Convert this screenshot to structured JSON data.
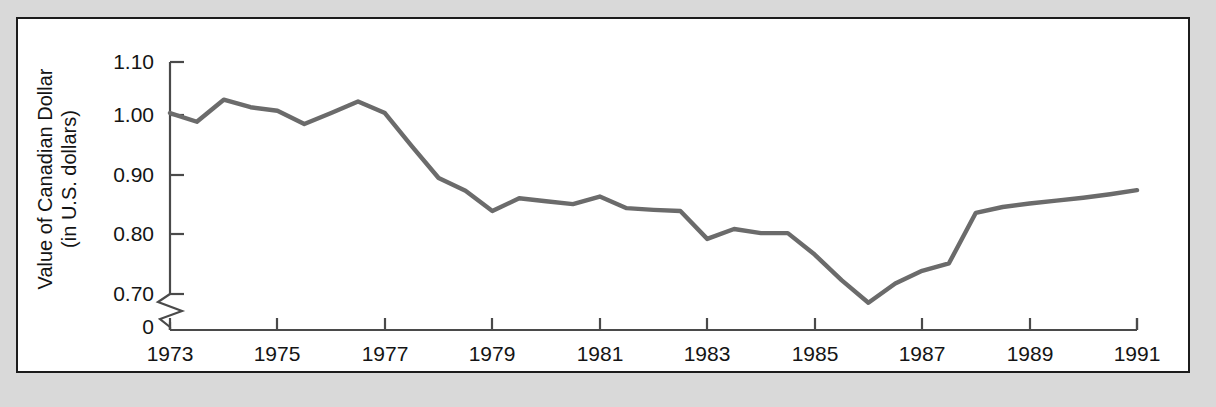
{
  "figure": {
    "background_color": "#d9d9d9",
    "panel_color": "#ffffff",
    "panel_border_color": "#1c1c1c"
  },
  "chart_data": {
    "type": "line",
    "title": "",
    "xlabel": "",
    "ylabel": "Value of Canadian Dollar (in U.S. dollars)",
    "ylabel_line1": "Value of Canadian Dollar",
    "ylabel_line2": "(in U.S. dollars)",
    "line_color": "#6b6b6b",
    "axis_color": "#4a4a4a",
    "grid": false,
    "legend": false,
    "legend_position": "none",
    "axis_break": true,
    "axis_break_note": "y-axis broken between 0 and 0.70",
    "xlim": [
      1973,
      1991
    ],
    "ylim": [
      0.7,
      1.1
    ],
    "yticks": [
      0,
      0.7,
      0.8,
      0.9,
      1.0,
      1.1
    ],
    "ytick_labels": [
      "0",
      "0.70",
      "0.80",
      "0.90",
      "1.00",
      "1.10"
    ],
    "xticks": [
      1973,
      1975,
      1977,
      1979,
      1981,
      1983,
      1985,
      1987,
      1989,
      1991
    ],
    "xtick_labels": [
      "1973",
      "1975",
      "1977",
      "1979",
      "1981",
      "1983",
      "1985",
      "1987",
      "1989",
      "1991"
    ],
    "x": [
      1973.0,
      1973.5,
      1974.0,
      1974.5,
      1975.0,
      1975.5,
      1976.0,
      1976.5,
      1977.0,
      1977.5,
      1978.0,
      1978.5,
      1979.0,
      1979.5,
      1980.0,
      1980.5,
      1981.0,
      1981.5,
      1982.0,
      1982.5,
      1983.0,
      1983.5,
      1984.0,
      1984.5,
      1985.0,
      1985.5,
      1986.0,
      1986.5,
      1987.0,
      1987.5,
      1988.0,
      1988.5,
      1989.0,
      1989.5,
      1990.0,
      1990.5,
      1991.0
    ],
    "values": [
      1.012,
      0.997,
      1.035,
      1.022,
      1.016,
      0.993,
      1.012,
      1.032,
      1.012,
      0.955,
      0.9,
      0.878,
      0.843,
      0.865,
      0.86,
      0.855,
      0.868,
      0.848,
      0.845,
      0.843,
      0.795,
      0.812,
      0.805,
      0.805,
      0.768,
      0.724,
      0.685,
      0.718,
      0.74,
      0.753,
      0.84,
      0.85,
      0.856,
      0.861,
      0.866,
      0.872,
      0.879
    ],
    "series_name": "Value of Canadian Dollar"
  }
}
